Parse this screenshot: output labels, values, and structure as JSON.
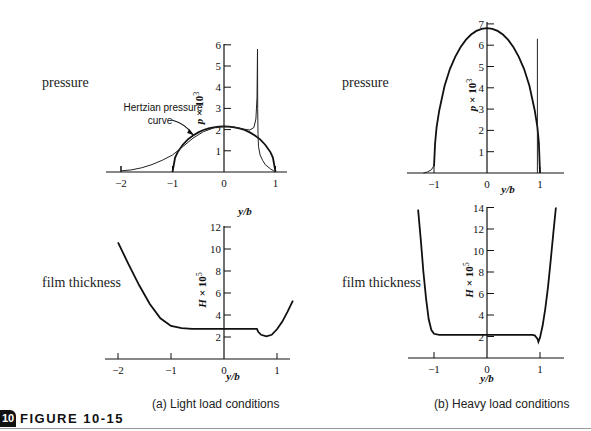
{
  "figure": {
    "number_badge": "10",
    "title": "FIGURE 10-15",
    "rule_color": "#9a9a9a"
  },
  "row_labels": {
    "top_left": "pressure",
    "top_right": "pressure",
    "bottom_left": "film thickness",
    "bottom_right": "film thickness"
  },
  "captions": {
    "a": "(a)  Light load conditions",
    "b": "(b)  Heavy load conditions"
  },
  "chart_data": [
    {
      "id": "a-pressure",
      "panel": "(a) Light load conditions",
      "type": "line",
      "title": "pressure",
      "xlabel": "y/b",
      "ylabel": "p × 10^3",
      "xlim": [
        -2.2,
        1.25
      ],
      "ylim": [
        0,
        6
      ],
      "xticks": [
        -2,
        -1,
        0,
        1
      ],
      "yticks": [
        1,
        2,
        3,
        4,
        5,
        6
      ],
      "grid": false,
      "annotation": {
        "text_line1": "Hertzian pressure",
        "text_line2": "curve",
        "points_to": [
          -0.6,
          1.75
        ]
      },
      "series": [
        {
          "name": "Hertzian pressure curve",
          "style": "thick",
          "x": [
            -1,
            -0.95,
            -0.9,
            -0.8,
            -0.7,
            -0.6,
            -0.5,
            -0.4,
            -0.3,
            -0.2,
            -0.1,
            0,
            0.1,
            0.2,
            0.3,
            0.4,
            0.5,
            0.6,
            0.7,
            0.8,
            0.9,
            0.95,
            1
          ],
          "y": [
            0,
            0.68,
            0.94,
            1.29,
            1.54,
            1.72,
            1.87,
            1.98,
            2.06,
            2.11,
            2.14,
            2.15,
            2.14,
            2.11,
            2.06,
            1.98,
            1.87,
            1.72,
            1.54,
            1.29,
            0.94,
            0.68,
            0
          ]
        },
        {
          "name": "EHL pressure (light load)",
          "style": "thin",
          "x": [
            -2,
            -1.8,
            -1.6,
            -1.4,
            -1.2,
            -1.0,
            -0.9,
            -0.8,
            -0.6,
            -0.4,
            -0.2,
            0,
            0.2,
            0.4,
            0.5,
            0.58,
            0.62,
            0.64,
            0.65,
            0.655,
            0.66,
            0.67,
            0.7,
            0.75,
            0.8,
            0.9,
            1.0
          ],
          "y": [
            0.05,
            0.1,
            0.2,
            0.35,
            0.55,
            0.8,
            1.0,
            1.2,
            1.6,
            1.9,
            2.08,
            2.15,
            2.12,
            2.02,
            1.98,
            2.1,
            2.5,
            3.5,
            5.8,
            3.0,
            1.8,
            1.2,
            0.8,
            0.55,
            0.35,
            0.15,
            0
          ]
        }
      ]
    },
    {
      "id": "b-pressure",
      "panel": "(b) Heavy load conditions",
      "type": "line",
      "title": "pressure",
      "xlabel": "y/b",
      "ylabel": "p × 10^3",
      "xlim": [
        -1.45,
        1.45
      ],
      "ylim": [
        0,
        7
      ],
      "xticks": [
        -1,
        0,
        1
      ],
      "yticks": [
        1,
        2,
        3,
        4,
        5,
        6,
        7
      ],
      "grid": false,
      "series": [
        {
          "name": "Hertzian / EHL pressure (heavy load)",
          "style": "thick",
          "x": [
            -1,
            -0.98,
            -0.95,
            -0.9,
            -0.8,
            -0.7,
            -0.6,
            -0.5,
            -0.4,
            -0.3,
            -0.2,
            -0.1,
            0,
            0.1,
            0.2,
            0.3,
            0.4,
            0.5,
            0.6,
            0.7,
            0.8,
            0.9,
            0.95,
            0.98,
            1
          ],
          "y": [
            0.3,
            1.4,
            2.15,
            2.95,
            4.1,
            4.88,
            5.45,
            5.9,
            6.25,
            6.5,
            6.67,
            6.77,
            6.8,
            6.77,
            6.67,
            6.5,
            6.25,
            5.9,
            5.45,
            4.88,
            4.1,
            2.95,
            2.15,
            1.4,
            0
          ]
        },
        {
          "name": "inlet tail",
          "style": "thin",
          "x": [
            -1.2,
            -1.12,
            -1.05,
            -1.0
          ],
          "y": [
            0,
            0.05,
            0.15,
            0.35
          ]
        },
        {
          "name": "pressure spike",
          "style": "thin",
          "x": [
            0.95,
            0.95
          ],
          "y": [
            0,
            6.3
          ]
        }
      ]
    },
    {
      "id": "a-film",
      "panel": "(a) Light load conditions",
      "type": "line",
      "title": "film thickness",
      "xlabel": "y/b",
      "ylabel": "H × 10^5",
      "xlim": [
        -2.2,
        1.25
      ],
      "ylim": [
        0,
        12
      ],
      "xticks": [
        -2,
        -1,
        0,
        1
      ],
      "yticks": [
        2,
        4,
        6,
        8,
        10,
        12
      ],
      "grid": false,
      "series": [
        {
          "name": "film thickness (light load)",
          "style": "thick",
          "x": [
            -2.0,
            -1.8,
            -1.6,
            -1.4,
            -1.2,
            -1.0,
            -0.8,
            -0.6,
            -0.4,
            -0.2,
            0,
            0.2,
            0.4,
            0.6,
            0.62,
            0.65,
            0.7,
            0.8,
            0.9,
            1.0,
            1.1,
            1.2,
            1.3
          ],
          "y": [
            10.6,
            8.6,
            6.7,
            5.0,
            3.7,
            3.0,
            2.8,
            2.75,
            2.75,
            2.75,
            2.75,
            2.75,
            2.75,
            2.75,
            2.75,
            2.45,
            2.2,
            2.05,
            2.2,
            2.7,
            3.4,
            4.3,
            5.3
          ]
        }
      ]
    },
    {
      "id": "b-film",
      "panel": "(b) Heavy load conditions",
      "type": "line",
      "title": "film thickness",
      "xlabel": "y/b",
      "ylabel": "H × 10^5",
      "xlim": [
        -1.45,
        1.45
      ],
      "ylim": [
        0,
        14
      ],
      "xticks": [
        -1,
        0,
        1
      ],
      "yticks": [
        2,
        4,
        6,
        8,
        10,
        12,
        14
      ],
      "grid": false,
      "series": [
        {
          "name": "film thickness (heavy load)",
          "style": "thick",
          "x": [
            -1.3,
            -1.25,
            -1.2,
            -1.15,
            -1.1,
            -1.05,
            -1.0,
            -0.9,
            -0.6,
            -0.3,
            0,
            0.3,
            0.6,
            0.85,
            0.9,
            0.95,
            0.97,
            1.0,
            1.05,
            1.1,
            1.15,
            1.2,
            1.25,
            1.3
          ],
          "y": [
            13.8,
            11.0,
            8.0,
            5.5,
            3.6,
            2.6,
            2.25,
            2.15,
            2.15,
            2.15,
            2.15,
            2.15,
            2.15,
            2.15,
            2.1,
            1.8,
            1.5,
            1.9,
            3.0,
            4.6,
            6.6,
            9.0,
            11.6,
            14.0
          ]
        }
      ]
    }
  ],
  "layout": {
    "panels": [
      {
        "id": "a-pressure",
        "originX": 224,
        "originY": 172,
        "pxPerX": 51.5,
        "pxPerY": 21.2,
        "axisLeft": 106,
        "axisRight": 287,
        "axisTop": 44,
        "yLabelX": 203,
        "yLabelY": 108,
        "xLabelX": 245,
        "xLabelY": 215
      },
      {
        "id": "b-pressure",
        "originX": 487,
        "originY": 173,
        "pxPerX": 53,
        "pxPerY": 21.3,
        "axisLeft": 407,
        "axisRight": 564,
        "axisTop": 22,
        "yLabelX": 476,
        "yLabelY": 95,
        "xLabelX": 508,
        "xLabelY": 193
      },
      {
        "id": "a-film",
        "originX": 224,
        "originY": 359,
        "pxPerX": 53,
        "pxPerY": 11,
        "axisLeft": 105,
        "axisRight": 290,
        "axisTop": 226,
        "yLabelX": 206,
        "yLabelY": 290,
        "xLabelX": 233,
        "xLabelY": 380
      },
      {
        "id": "b-film",
        "originX": 487,
        "originY": 358,
        "pxPerX": 53,
        "pxPerY": 10.75,
        "axisLeft": 408,
        "axisRight": 564,
        "axisTop": 207,
        "yLabelX": 473,
        "yLabelY": 280,
        "xLabelX": 487,
        "xLabelY": 382
      }
    ]
  }
}
